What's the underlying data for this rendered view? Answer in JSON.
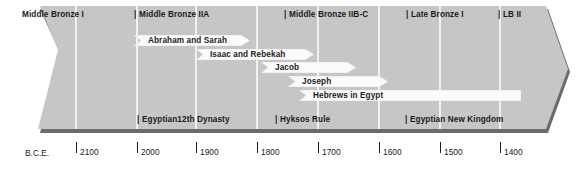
{
  "figure": {
    "kind": "historical-timeline",
    "era_label": "B.C.E.",
    "colors": {
      "band_fill": "#c6c6c6",
      "band_shadow": "#6b6b6b",
      "arrow_fill": "#fbfbfb",
      "arrow_edge": "#d8d8d8",
      "divider": "#fdfdfd",
      "text": "#1b1b1b",
      "axis": "#1b1b1b"
    }
  },
  "axis": {
    "label": "B.C.E.",
    "ticks": [
      {
        "value": "2100",
        "x": 76
      },
      {
        "value": "2000",
        "x": 137
      },
      {
        "value": "1900",
        "x": 196
      },
      {
        "value": "1800",
        "x": 257
      },
      {
        "value": "1700",
        "x": 318
      },
      {
        "value": "1600",
        "x": 379
      },
      {
        "value": "1500",
        "x": 440
      },
      {
        "value": "1400",
        "x": 500
      }
    ]
  },
  "top_periods": [
    {
      "name": "Middle Bronze I",
      "label": "Middle Bronze I",
      "tick": false,
      "x": 22,
      "y": 10
    },
    {
      "name": "Middle Bronze IIA",
      "label": "Middle Bronze IIA",
      "tick": true,
      "x": 134,
      "y": 10
    },
    {
      "name": "Middle Bronze IIB-C",
      "label": "Middle Bronze IIB-C",
      "tick": true,
      "x": 284,
      "y": 10
    },
    {
      "name": "Late Bronze I",
      "label": "Late Bronze I",
      "tick": true,
      "x": 406,
      "y": 10
    },
    {
      "name": "LB II",
      "label": "LB II",
      "tick": true,
      "x": 498,
      "y": 10
    }
  ],
  "bottom_periods": [
    {
      "name": "Egyptian 12th Dynasty",
      "label": "Egyptian12th Dynasty",
      "tick": true,
      "x": 137,
      "y": 115
    },
    {
      "name": "Hyksos Rule",
      "label": "Hyksos Rule",
      "tick": true,
      "x": 275,
      "y": 115
    },
    {
      "name": "Egyptian New Kingdom",
      "label": "Egyptian New Kingdom",
      "tick": true,
      "x": 405,
      "y": 115
    }
  ],
  "person_bands": [
    {
      "name": "Abraham and Sarah",
      "label": "Abraham and Sarah",
      "x": 134,
      "y": 35,
      "width": 116,
      "text_x": 14
    },
    {
      "name": "Isaac and Rebekah",
      "label": "Isaac and Rebekah",
      "x": 196,
      "y": 49,
      "width": 118,
      "text_x": 14
    },
    {
      "name": "Jacob",
      "label": "Jacob",
      "x": 261,
      "y": 62,
      "width": 95,
      "text_x": 14
    },
    {
      "name": "Joseph",
      "label": "Joseph",
      "x": 288,
      "y": 76,
      "width": 100,
      "text_x": 14
    },
    {
      "name": "Hebrews in Egypt",
      "label": "Hebrews in Egypt",
      "x": 299,
      "y": 90,
      "width": 222,
      "text_x": 14
    }
  ],
  "dividers": [
    76,
    137,
    196,
    257,
    318,
    379,
    440,
    500
  ]
}
